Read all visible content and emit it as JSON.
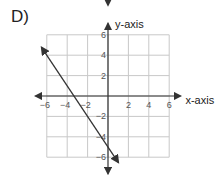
{
  "label": "D)",
  "chart_data": {
    "type": "line",
    "title": "",
    "xlabel": "x-axis",
    "ylabel": "y-axis",
    "xlim": [
      -6,
      6
    ],
    "ylim": [
      -6,
      6
    ],
    "xticks": [
      -6,
      -4,
      -2,
      2,
      4,
      6
    ],
    "yticks": [
      6,
      4,
      2,
      -2,
      -4,
      -6
    ],
    "grid": true,
    "series": [
      {
        "name": "line",
        "x": [
          -6.5,
          1
        ],
        "y": [
          4.75,
          -6.5
        ],
        "arrows": "both"
      }
    ]
  }
}
